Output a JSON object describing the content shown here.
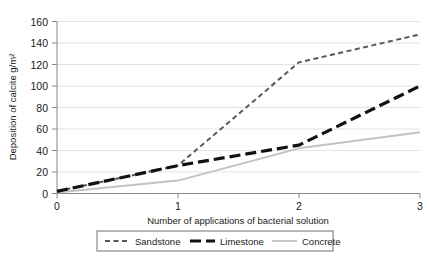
{
  "chart_data": {
    "type": "line",
    "title": "",
    "xlabel": "Number of applications of bacterial solution",
    "ylabel": "Deposition of calcite g/m²",
    "x": [
      0,
      1,
      2,
      3
    ],
    "xticklabels": [
      "0",
      "1",
      "2",
      "3"
    ],
    "yticklabels": [
      "0",
      "20",
      "40",
      "60",
      "80",
      "100",
      "120",
      "140",
      "160"
    ],
    "xlim": [
      0,
      3
    ],
    "ylim": [
      0,
      160
    ],
    "ytick_step": 20,
    "grid": "horizontal",
    "legend_position": "bottom",
    "series": [
      {
        "name": "Sandstone",
        "values": [
          2,
          26,
          122,
          148
        ],
        "color": "#59595b",
        "style": "dashed",
        "width": 2
      },
      {
        "name": "Limestone",
        "values": [
          2,
          26,
          45,
          100
        ],
        "color": "#111111",
        "style": "dashed-thick",
        "width": 3.2
      },
      {
        "name": "Concrete",
        "values": [
          1,
          12,
          42,
          57
        ],
        "color": "#c2c2c2",
        "style": "solid",
        "width": 2
      }
    ]
  },
  "axes": {
    "yticks": [
      "160",
      "140",
      "120",
      "100",
      "80",
      "60",
      "40",
      "20",
      "0"
    ],
    "xticks": [
      "0",
      "1",
      "2",
      "3"
    ]
  },
  "legend": {
    "items": [
      {
        "label": "Sandstone"
      },
      {
        "label": "Limestone"
      },
      {
        "label": "Concrete"
      }
    ]
  },
  "colors": {
    "sandstone": "#59595b",
    "limestone": "#111111",
    "concrete": "#c2c2c2",
    "grid": "#e3e3e3",
    "axis": "#8a8a8a",
    "text": "#1a1a1a",
    "legend_border": "#6e6e6e",
    "background": "#ffffff"
  }
}
